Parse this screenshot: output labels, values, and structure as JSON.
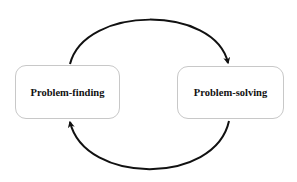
{
  "diagram": {
    "type": "cycle",
    "nodes": [
      {
        "id": "problem-finding",
        "label": "Problem-finding"
      },
      {
        "id": "problem-solving",
        "label": "Problem-solving"
      }
    ],
    "edges": [
      {
        "from": "problem-finding",
        "to": "problem-solving",
        "path": "top-arc"
      },
      {
        "from": "problem-solving",
        "to": "problem-finding",
        "path": "bottom-arc"
      }
    ],
    "colors": {
      "arrow": "#111111",
      "node_border": "#c8c8c8",
      "background": "#ffffff"
    }
  }
}
